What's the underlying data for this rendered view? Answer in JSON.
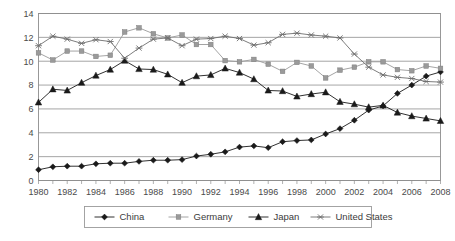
{
  "chart_data": {
    "type": "line",
    "title": "",
    "subtitle": "",
    "xlabel": "",
    "ylabel": "",
    "xlim": [
      1980,
      2008
    ],
    "ylim": [
      0,
      14
    ],
    "ytick_step": 2,
    "xtick_step": 2,
    "grid": "horizontal",
    "legend_position": "bottom",
    "x": [
      1980,
      1981,
      1982,
      1983,
      1984,
      1985,
      1986,
      1987,
      1988,
      1989,
      1990,
      1991,
      1992,
      1993,
      1994,
      1995,
      1996,
      1997,
      1998,
      1999,
      2000,
      2001,
      2002,
      2003,
      2004,
      2005,
      2006,
      2007,
      2008
    ],
    "xticklabels": [
      "1980",
      "1982",
      "1984",
      "1986",
      "1988",
      "1990",
      "1992",
      "1994",
      "1996",
      "1998",
      "2000",
      "2002",
      "2004",
      "2006",
      "2008"
    ],
    "yticklabels": [
      "0",
      "2",
      "4",
      "6",
      "8",
      "10",
      "12",
      "14"
    ],
    "series": [
      {
        "name": "China",
        "marker": "diamond",
        "color": "#1a1a1a",
        "values": [
          0.9,
          1.15,
          1.2,
          1.2,
          1.4,
          1.45,
          1.45,
          1.6,
          1.7,
          1.7,
          1.75,
          2.05,
          2.2,
          2.4,
          2.8,
          2.9,
          2.75,
          3.25,
          3.35,
          3.4,
          3.9,
          4.35,
          5.05,
          5.9,
          6.25,
          7.3,
          8.0,
          8.75,
          9.1
        ]
      },
      {
        "name": "Germany",
        "marker": "square",
        "color": "#9a9a9a",
        "values": [
          10.7,
          10.1,
          10.85,
          10.85,
          10.4,
          10.5,
          12.45,
          12.8,
          12.3,
          11.95,
          12.2,
          11.4,
          11.4,
          10.05,
          9.95,
          10.15,
          9.75,
          9.15,
          9.9,
          9.6,
          8.6,
          9.25,
          9.5,
          9.95,
          9.95,
          9.3,
          9.2,
          9.6,
          9.4
        ]
      },
      {
        "name": "Japan",
        "marker": "triangle",
        "color": "#1a1a1a",
        "values": [
          6.55,
          7.65,
          7.55,
          8.2,
          8.8,
          9.3,
          10.05,
          9.35,
          9.3,
          8.9,
          8.2,
          8.75,
          8.85,
          9.4,
          9.05,
          8.5,
          7.55,
          7.5,
          7.05,
          7.25,
          7.4,
          6.6,
          6.4,
          6.15,
          6.3,
          5.7,
          5.4,
          5.2,
          5.0
        ]
      },
      {
        "name": "United States",
        "marker": "cross",
        "color": "#6e6e6e",
        "values": [
          11.3,
          12.1,
          11.85,
          11.5,
          11.8,
          11.65,
          10.25,
          11.1,
          11.85,
          11.95,
          11.3,
          11.85,
          11.9,
          12.1,
          11.9,
          11.35,
          11.55,
          12.25,
          12.35,
          12.2,
          12.1,
          11.95,
          10.6,
          9.5,
          8.85,
          8.65,
          8.55,
          8.3,
          8.25
        ]
      }
    ]
  },
  "legend": {
    "items": [
      {
        "label": "China"
      },
      {
        "label": "Germany"
      },
      {
        "label": "Japan"
      },
      {
        "label": "United States"
      }
    ]
  },
  "caption": {
    "text": ""
  }
}
